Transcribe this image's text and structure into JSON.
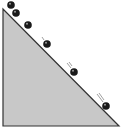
{
  "diagram": {
    "colors": {
      "background": "#ffffff",
      "incline_fill": "#c8c8c8",
      "incline_stroke": "#333333",
      "ball": "#1a1a1a",
      "ball_highlight": "#9a9a9a",
      "motion_lines": "#888888"
    },
    "incline": {
      "vertices": [
        [
          3,
          9
        ],
        [
          3,
          126
        ],
        [
          119,
          126
        ]
      ]
    },
    "balls": [
      {
        "cx": 11,
        "cy": 5,
        "r": 3.8
      },
      {
        "cx": 16,
        "cy": 13,
        "r": 3.8
      },
      {
        "cx": 28,
        "cy": 25,
        "r": 3.8
      },
      {
        "cx": 47,
        "cy": 44,
        "r": 3.8
      },
      {
        "cx": 74,
        "cy": 72,
        "r": 3.8
      },
      {
        "cx": 106,
        "cy": 106,
        "r": 3.8
      }
    ],
    "motion_marks": [
      {
        "x1": 42,
        "y1": 37,
        "x2": 44,
        "y2": 40
      },
      {
        "x1": 67,
        "y1": 63,
        "x2": 71,
        "y2": 68
      },
      {
        "x1": 69,
        "y1": 62,
        "x2": 72,
        "y2": 66
      },
      {
        "x1": 97,
        "y1": 94,
        "x2": 103,
        "y2": 102
      },
      {
        "x1": 99,
        "y1": 93,
        "x2": 104,
        "y2": 100
      }
    ]
  }
}
